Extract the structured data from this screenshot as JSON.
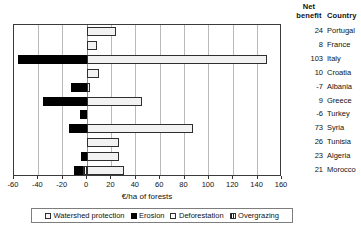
{
  "header": {
    "net_benefit_label": "Net\nbenefit",
    "net_benefit_line1": "Net",
    "net_benefit_line2": "benefit",
    "country_label": "Country"
  },
  "chart_data": {
    "type": "bar",
    "orientation": "horizontal",
    "stacked": true,
    "title": "",
    "xlabel": "€/ha of forests",
    "ylabel": "",
    "xlim": [
      -60,
      160
    ],
    "xticks": [
      -60,
      -40,
      -20,
      0,
      20,
      40,
      60,
      80,
      100,
      120,
      140,
      160
    ],
    "xtick_labels": [
      "-60",
      "-40",
      "-20",
      "0",
      "20",
      "40",
      "60",
      "80",
      "100",
      "120",
      "140",
      "160"
    ],
    "grid": true,
    "grid_axis": "x",
    "legend_position": "below",
    "categories": [
      "Portugal",
      "France",
      "Italy",
      "Croatia",
      "Albania",
      "Greece",
      "Turkey",
      "Syria",
      "Tunisia",
      "Algeria",
      "Morocco"
    ],
    "series": [
      {
        "name": "Watershed protection",
        "color": "#f2f2f2",
        "values": [
          24,
          8,
          148,
          10,
          2,
          45,
          0,
          87,
          26,
          26,
          30
        ]
      },
      {
        "name": "Erosion",
        "color": "#000000",
        "values": [
          0,
          0,
          -57,
          0,
          -13,
          -36,
          -6,
          -15,
          0,
          -5,
          -8
        ]
      },
      {
        "name": "Deforestation",
        "color": "#fbfbfb",
        "values": [
          0,
          0,
          0,
          0,
          0,
          0,
          0,
          0,
          0,
          0,
          0
        ]
      },
      {
        "name": "Overgrazing",
        "color": "#1d1d1d",
        "values": [
          0,
          0,
          0,
          0,
          0,
          0,
          0,
          0,
          0,
          0,
          -3
        ]
      }
    ],
    "net_benefit": [
      24,
      8,
      103,
      10,
      -7,
      9,
      -6,
      73,
      26,
      23,
      21
    ]
  },
  "rows": [
    {
      "country": "Portugal",
      "net_benefit": "24"
    },
    {
      "country": "France",
      "net_benefit": "8"
    },
    {
      "country": "Italy",
      "net_benefit": "103"
    },
    {
      "country": "Croatia",
      "net_benefit": "10"
    },
    {
      "country": "Albania",
      "net_benefit": "-7"
    },
    {
      "country": "Greece",
      "net_benefit": "9"
    },
    {
      "country": "Turkey",
      "net_benefit": "-6"
    },
    {
      "country": "Syria",
      "net_benefit": "73"
    },
    {
      "country": "Tunisia",
      "net_benefit": "26"
    },
    {
      "country": "Algeria",
      "net_benefit": "23"
    },
    {
      "country": "Morocco",
      "net_benefit": "21"
    }
  ],
  "legend": {
    "items": [
      {
        "label": "Watershed protection",
        "key": "watershed"
      },
      {
        "label": "Erosion",
        "key": "erosion"
      },
      {
        "label": "Deforestation",
        "key": "deforestation"
      },
      {
        "label": "Overgrazing",
        "key": "overgrazing"
      }
    ]
  }
}
